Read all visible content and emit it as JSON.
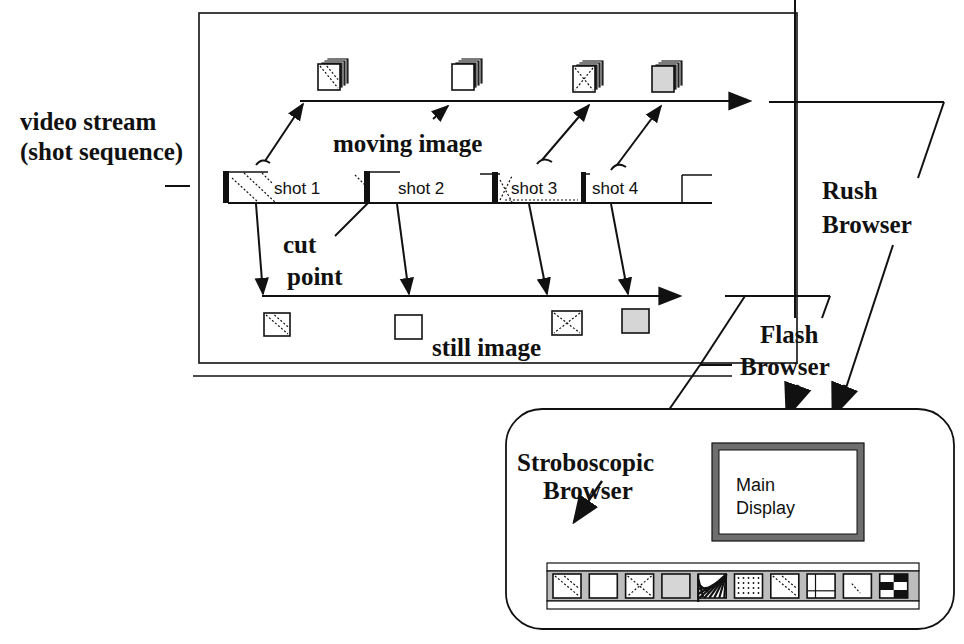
{
  "labels": {
    "video_stream_1": "video stream",
    "video_stream_2": "(shot sequence)",
    "moving_image": "moving image",
    "cut_point_1": "cut",
    "cut_point_2": "point",
    "still_image": "still image",
    "rush_1": "Rush",
    "rush_2": "Browser",
    "flash_1": "Flash",
    "flash_2": "Browser",
    "strobo_1": "Stroboscopic",
    "strobo_2": "Browser",
    "main_display_1": "Main",
    "main_display_2": "Display"
  },
  "shots": [
    {
      "label": "shot 1",
      "pattern": "diagonal-hatch"
    },
    {
      "label": "shot 2",
      "pattern": "blank"
    },
    {
      "label": "shot 3",
      "pattern": "cross-hatch"
    },
    {
      "label": "shot 4",
      "pattern": "blank"
    }
  ],
  "moving_images": [
    "diagonal",
    "blank",
    "cross",
    "gray"
  ],
  "still_images": [
    "diagonal",
    "blank",
    "cross",
    "gray"
  ],
  "strobo_thumbnails": [
    "diagonal",
    "blank",
    "cross",
    "gray",
    "stripes",
    "dots",
    "diagonal",
    "panes",
    "dashes",
    "checker"
  ],
  "colors": {
    "ink": "#111111",
    "gray_fill": "#d6d6d6",
    "bezel": "#6e6e6e",
    "strip": "#bdbdbd"
  }
}
